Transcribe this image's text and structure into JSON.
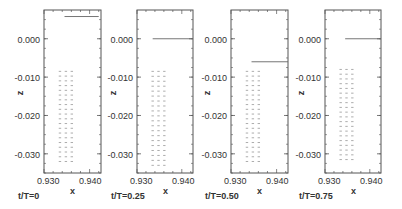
{
  "chart_data": [
    {
      "type": "scatter",
      "subtype": "vector-field",
      "caption": "t/T=0",
      "xlabel": "x",
      "ylabel": "z",
      "xlim": [
        0.93,
        0.9425
      ],
      "ylim": [
        -0.035,
        0.0075
      ],
      "xticks": [
        "0.930",
        "0.940"
      ],
      "yticks": [
        "0.000",
        "-0.010",
        "-0.020",
        "-0.030"
      ],
      "grid": false,
      "free_surface": {
        "z": 0.0058,
        "x_start": 0.9345,
        "x_end": 0.942
      },
      "vector_columns_x": [
        0.9335,
        0.9348,
        0.9361
      ],
      "vector_z_range": [
        -0.032,
        -0.0085
      ]
    },
    {
      "type": "scatter",
      "subtype": "vector-field",
      "caption": "t/T=0.25",
      "xlabel": "x",
      "ylabel": "z",
      "xlim": [
        0.93,
        0.9425
      ],
      "ylim": [
        -0.035,
        0.0075
      ],
      "xticks": [
        "0.930",
        "0.940"
      ],
      "yticks": [
        "0.000",
        "-0.010",
        "-0.020",
        "-0.030"
      ],
      "grid": false,
      "free_surface": {
        "z": 0.0,
        "x_start": 0.9335,
        "x_end": 0.9425
      },
      "vector_columns_x": [
        0.9335,
        0.9348,
        0.9361
      ],
      "vector_z_range": [
        -0.033,
        -0.0085
      ]
    },
    {
      "type": "scatter",
      "subtype": "vector-field",
      "caption": "t/T=0.50",
      "xlabel": "x",
      "ylabel": "z",
      "xlim": [
        0.93,
        0.9425
      ],
      "ylim": [
        -0.035,
        0.0075
      ],
      "xticks": [
        "0.930",
        "0.940"
      ],
      "yticks": [
        "0.000",
        "-0.010",
        "-0.020",
        "-0.030"
      ],
      "grid": false,
      "free_surface": {
        "z": -0.006,
        "x_start": 0.9345,
        "x_end": 0.9425
      },
      "vector_columns_x": [
        0.9335,
        0.9348,
        0.9361
      ],
      "vector_z_range": [
        -0.032,
        -0.0085
      ]
    },
    {
      "type": "scatter",
      "subtype": "vector-field",
      "caption": "t/T=0.75",
      "xlabel": "x",
      "ylabel": "z",
      "xlim": [
        0.93,
        0.9425
      ],
      "ylim": [
        -0.035,
        0.0075
      ],
      "xticks": [
        "0.930",
        "0.940"
      ],
      "yticks": [
        "0.000",
        "-0.010",
        "-0.020",
        "-0.030"
      ],
      "grid": false,
      "free_surface": {
        "z": 0.0,
        "x_start": 0.9345,
        "x_end": 0.9425
      },
      "vector_columns_x": [
        0.9335,
        0.9348,
        0.9361
      ],
      "vector_z_range": [
        -0.0315,
        -0.008
      ]
    }
  ],
  "panels": [
    {
      "caption": "t/T=0",
      "xlabel": "x",
      "ylabel": "z",
      "yticks": [
        "0.000",
        "-0.010",
        "-0.020",
        "-0.030"
      ],
      "xticks": [
        "0.930",
        "0.940"
      ]
    },
    {
      "caption": "t/T=0.25",
      "xlabel": "x",
      "ylabel": "z",
      "yticks": [
        "0.000",
        "-0.010",
        "-0.020",
        "-0.030"
      ],
      "xticks": [
        "0.930",
        "0.940"
      ]
    },
    {
      "caption": "t/T=0.50",
      "xlabel": "x",
      "ylabel": "z",
      "yticks": [
        "0.000",
        "-0.010",
        "-0.020",
        "-0.030"
      ],
      "xticks": [
        "0.930",
        "0.940"
      ]
    },
    {
      "caption": "t/T=0.75",
      "xlabel": "x",
      "ylabel": "z",
      "yticks": [
        "0.000",
        "-0.010",
        "-0.020",
        "-0.030"
      ],
      "xticks": [
        "0.930",
        "0.940"
      ]
    }
  ],
  "colors": {
    "frame": "#555555",
    "line": "#666666",
    "vector": "#888888"
  }
}
